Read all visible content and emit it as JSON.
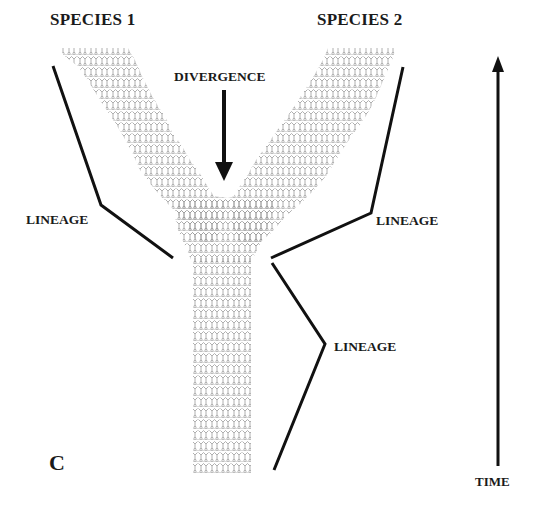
{
  "figure": {
    "panel_label": "C",
    "species": [
      {
        "label": "SPECIES 1"
      },
      {
        "label": "SPECIES 2"
      }
    ],
    "event": {
      "label": "DIVERGENCE",
      "icon": "arrow-down-icon"
    },
    "lineages": [
      {
        "label": "LINEAGE",
        "side": "left-branch"
      },
      {
        "label": "LINEAGE",
        "side": "right-branch"
      },
      {
        "label": "LINEAGE",
        "side": "trunk"
      }
    ],
    "axis": {
      "label": "TIME",
      "icon": "arrow-up-icon",
      "direction": "up"
    }
  },
  "colors": {
    "lines": "#111111",
    "lattice": "#9a9a9a",
    "text": "#1a1a1a",
    "background": "#ffffff"
  }
}
